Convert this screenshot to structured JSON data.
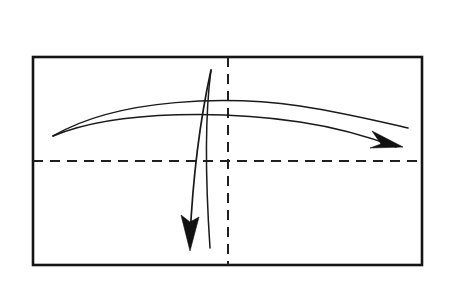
{
  "figure": {
    "kind": "origami-fold-instruction-diagram",
    "title": "",
    "caption": "",
    "background_color": "#ffffff",
    "ink_color": "#1a1a1a",
    "canvas": {
      "width": 452,
      "height": 285
    }
  },
  "paper_sheet": {
    "name": "rectangular-sheet-outline",
    "label": "",
    "stroke_color": "#141414",
    "stroke_width": 2.6,
    "fill_color": "#ffffff",
    "left": 33,
    "top": 57,
    "right": 422,
    "bottom": 265,
    "width": 389,
    "height": 208
  },
  "fold_lines": [
    {
      "name": "horizontal-center-fold-line",
      "label": "",
      "orientation": "horizontal",
      "style": "dashed",
      "stroke_color": "#1f1f1f",
      "stroke_width": 2.0,
      "dash_length": 10,
      "gap_length": 7,
      "x1": 33,
      "y1": 161,
      "x2": 422,
      "y2": 161
    },
    {
      "name": "vertical-center-fold-line",
      "label": "",
      "orientation": "vertical",
      "style": "dashed",
      "stroke_color": "#1f1f1f",
      "stroke_width": 2.0,
      "dash_length": 10,
      "gap_length": 7,
      "x1": 228,
      "y1": 57,
      "x2": 228,
      "y2": 265
    }
  ],
  "arrows": [
    {
      "name": "horizontal-fold-arrow",
      "label": "",
      "direction": "right",
      "description": "long curved arrow arcing left-to-right across the sheet",
      "stroke_color": "#1a1a1a",
      "stroke_width": 1.5,
      "outer_path": "M 53,136 C 120,97 230,96 300,106 C 345,113 382,122 408,128",
      "inner_path": "M 53,136 C 120,108 235,112 300,122 C 340,128 372,138 396,147",
      "arrowhead": {
        "name": "horizontal-arrowhead",
        "tip_x": 403,
        "tip_y": 147,
        "points": "403,147 372,131 381,144 370,148",
        "fill_color": "#111111"
      }
    },
    {
      "name": "vertical-fold-arrow",
      "label": "",
      "direction": "down",
      "description": "curved arrow sweeping downward near the vertical fold line",
      "stroke_color": "#1a1a1a",
      "stroke_width": 1.5,
      "outer_path": "M 211,70 C 200,120 193,175 190,238",
      "inner_path": "M 211,70 C 204,122 206,188 210,248",
      "arrowhead": {
        "name": "vertical-arrowhead",
        "tip_x": 190,
        "tip_y": 251,
        "points": "190,251 181,215 190,222 199,217",
        "fill_color": "#111111"
      }
    }
  ],
  "accessibility": {
    "summary": "A rectangular sheet of paper with dashed horizontal and vertical center fold lines, a curved arrow pointing right and a curved arrow pointing down."
  }
}
